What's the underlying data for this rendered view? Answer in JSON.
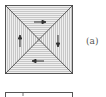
{
  "figure": {
    "label": "(a)",
    "arrows": [
      {
        "region": "top",
        "direction": "right"
      },
      {
        "region": "right",
        "direction": "down"
      },
      {
        "region": "bottom",
        "direction": "left"
      },
      {
        "region": "left",
        "direction": "up"
      }
    ],
    "colors": {
      "line": "#444444",
      "hatch": "#bdbdbd",
      "fill": "#ececec"
    }
  }
}
